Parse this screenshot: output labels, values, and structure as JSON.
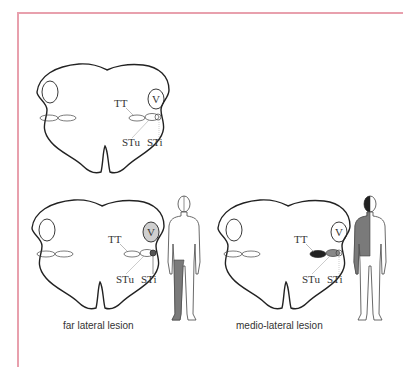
{
  "figure": {
    "frame_color": "#e8a0ad",
    "labels": {
      "tt": "TT",
      "v": "V",
      "stu": "STu",
      "sti": "STi"
    },
    "panels": [
      {
        "id": "normal",
        "caption": ""
      },
      {
        "id": "far-lateral",
        "caption": "far lateral lesion",
        "shaded_region": "left leg (ipsilateral lower body)"
      },
      {
        "id": "medio-lateral",
        "caption": "medio-lateral lesion",
        "shaded_region": "left upper body and head half"
      }
    ],
    "colors": {
      "outline": "#222222",
      "lesion_dark": "#222222",
      "lesion_mid": "#888888",
      "body_shade": "#7a7a7a",
      "v_shade": "#cfcfcf"
    }
  }
}
